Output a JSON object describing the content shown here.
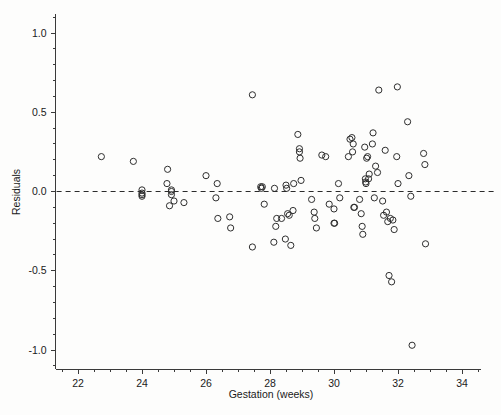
{
  "chart_data": {
    "type": "scatter",
    "title": "",
    "xlabel": "Gestation (weeks)",
    "ylabel": "Residuals",
    "xlim": [
      21.3,
      34.6
    ],
    "ylim": [
      -1.12,
      1.12
    ],
    "xticks": [
      22,
      24,
      26,
      28,
      30,
      32,
      34
    ],
    "xtick_labels": [
      "22",
      "24",
      "26",
      "28",
      "30",
      "32",
      "34"
    ],
    "yticks": [
      -1.0,
      -0.5,
      0.0,
      0.5,
      1.0
    ],
    "ytick_labels": [
      "-1.0",
      "-0.5",
      "0.0",
      "0.5",
      "1.0"
    ],
    "x_minor_step": 0.5,
    "y_minor_step": 0.1,
    "grid": false,
    "legend": null,
    "reference_lines": [
      {
        "axis": "y",
        "value": 0.0,
        "style": "dashed"
      }
    ],
    "marker": {
      "shape": "circle-open",
      "radius": 3.1,
      "color": "#2e2e2e"
    },
    "points": [
      [
        22.73,
        0.22
      ],
      [
        23.73,
        0.19
      ],
      [
        24.0,
        0.01
      ],
      [
        24.0,
        -0.01
      ],
      [
        24.0,
        -0.02
      ],
      [
        24.0,
        -0.03
      ],
      [
        24.78,
        0.05
      ],
      [
        24.8,
        0.14
      ],
      [
        24.92,
        0.01
      ],
      [
        24.92,
        0.0
      ],
      [
        24.92,
        -0.02
      ],
      [
        24.86,
        -0.09
      ],
      [
        25.0,
        -0.06
      ],
      [
        25.31,
        -0.07
      ],
      [
        26.0,
        0.1
      ],
      [
        26.35,
        0.05
      ],
      [
        26.31,
        -0.04
      ],
      [
        26.37,
        -0.17
      ],
      [
        26.74,
        -0.16
      ],
      [
        26.77,
        -0.23
      ],
      [
        27.45,
        0.61
      ],
      [
        27.45,
        -0.35
      ],
      [
        27.71,
        0.03
      ],
      [
        27.76,
        0.03
      ],
      [
        27.73,
        0.02
      ],
      [
        27.82,
        -0.08
      ],
      [
        28.14,
        0.02
      ],
      [
        28.12,
        -0.32
      ],
      [
        28.18,
        -0.22
      ],
      [
        28.21,
        -0.17
      ],
      [
        28.36,
        -0.17
      ],
      [
        28.48,
        -0.3
      ],
      [
        28.5,
        0.04
      ],
      [
        28.52,
        0.02
      ],
      [
        28.55,
        -0.14
      ],
      [
        28.6,
        -0.15
      ],
      [
        28.65,
        -0.34
      ],
      [
        28.72,
        -0.12
      ],
      [
        28.74,
        0.05
      ],
      [
        28.87,
        0.36
      ],
      [
        28.92,
        0.27
      ],
      [
        28.92,
        0.25
      ],
      [
        28.94,
        0.21
      ],
      [
        28.97,
        0.07
      ],
      [
        29.3,
        -0.05
      ],
      [
        29.38,
        -0.13
      ],
      [
        29.4,
        -0.17
      ],
      [
        29.45,
        -0.23
      ],
      [
        29.62,
        0.23
      ],
      [
        29.74,
        0.22
      ],
      [
        29.85,
        -0.08
      ],
      [
        30.0,
        -0.11
      ],
      [
        30.0,
        -0.2
      ],
      [
        30.02,
        -0.2
      ],
      [
        30.14,
        0.05
      ],
      [
        30.18,
        -0.04
      ],
      [
        30.45,
        0.22
      ],
      [
        30.5,
        0.33
      ],
      [
        30.56,
        0.34
      ],
      [
        30.6,
        0.3
      ],
      [
        30.58,
        0.25
      ],
      [
        30.62,
        -0.1
      ],
      [
        30.64,
        -0.1
      ],
      [
        30.8,
        -0.05
      ],
      [
        30.85,
        -0.14
      ],
      [
        30.88,
        -0.22
      ],
      [
        30.9,
        -0.27
      ],
      [
        30.96,
        0.28
      ],
      [
        30.98,
        0.08
      ],
      [
        30.99,
        0.06
      ],
      [
        31.0,
        0.05
      ],
      [
        31.02,
        0.21
      ],
      [
        31.05,
        0.22
      ],
      [
        31.08,
        0.08
      ],
      [
        31.1,
        0.11
      ],
      [
        31.22,
        0.37
      ],
      [
        31.2,
        0.3
      ],
      [
        31.26,
        -0.04
      ],
      [
        31.3,
        0.16
      ],
      [
        31.36,
        0.12
      ],
      [
        31.4,
        0.64
      ],
      [
        31.52,
        -0.06
      ],
      [
        31.55,
        -0.15
      ],
      [
        31.6,
        0.26
      ],
      [
        31.64,
        -0.13
      ],
      [
        31.68,
        -0.19
      ],
      [
        31.72,
        -0.53
      ],
      [
        31.76,
        -0.17
      ],
      [
        31.8,
        -0.57
      ],
      [
        31.84,
        -0.18
      ],
      [
        31.88,
        -0.24
      ],
      [
        31.96,
        0.22
      ],
      [
        31.98,
        0.66
      ],
      [
        32.0,
        0.05
      ],
      [
        32.3,
        0.44
      ],
      [
        32.34,
        0.1
      ],
      [
        32.4,
        -0.03
      ],
      [
        32.44,
        -0.97
      ],
      [
        32.8,
        0.24
      ],
      [
        32.84,
        0.17
      ],
      [
        32.86,
        -0.33
      ]
    ]
  },
  "axis_labels": {
    "x_title": "Gestation (weeks)",
    "y_title": "Residuals"
  }
}
